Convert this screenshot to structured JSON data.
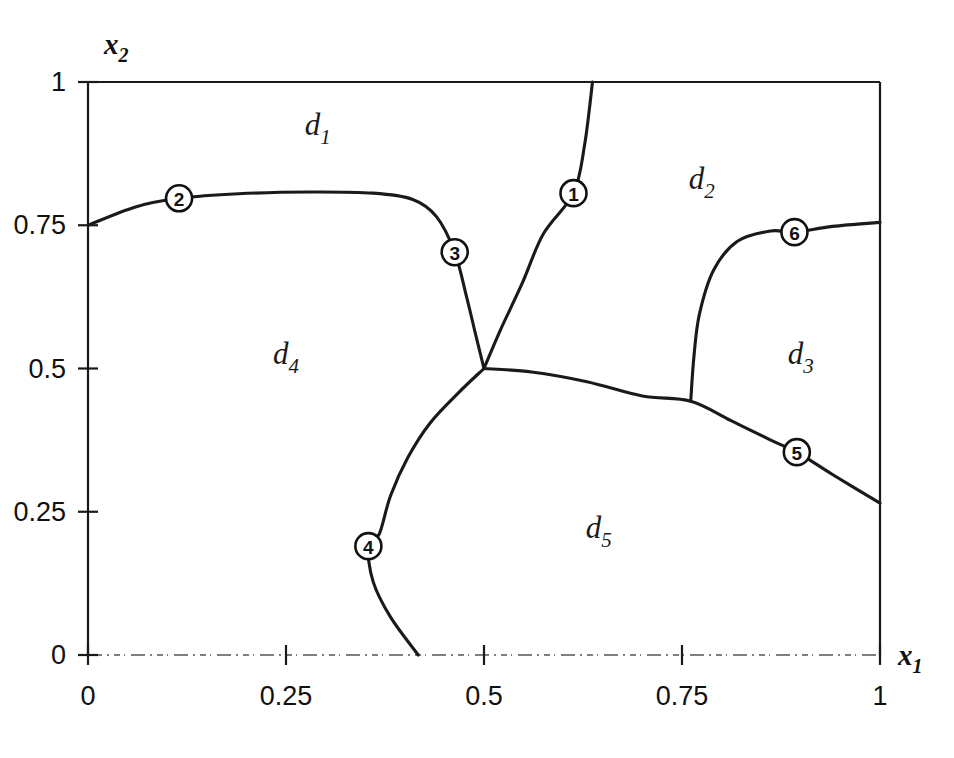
{
  "figure": {
    "kind": "region-partition-diagram",
    "background": "#ffffff",
    "ink_color": "#1a1a1a"
  },
  "chart_data": {
    "type": "scatter",
    "title": "",
    "subtitle": "",
    "xlabel": "x_1",
    "ylabel": "x_2",
    "xlim": [
      0,
      1
    ],
    "ylim": [
      0,
      1
    ],
    "grid": false,
    "legend": "none",
    "xticks": [
      "0",
      "0.25",
      "0.5",
      "0.75",
      "1"
    ],
    "xtick_values": [
      0,
      0.25,
      0.5,
      0.75,
      1
    ],
    "yticks": [
      "0",
      "0.25",
      "0.5",
      "0.75",
      "1"
    ],
    "ytick_values": [
      0,
      0.25,
      0.5,
      0.75,
      1
    ],
    "regions": [
      {
        "id": "d1",
        "label": "d",
        "sub": "1",
        "x": 0.29,
        "y": 0.925
      },
      {
        "id": "d2",
        "label": "d",
        "sub": "2",
        "x": 0.775,
        "y": 0.83
      },
      {
        "id": "d3",
        "label": "d",
        "sub": "3",
        "x": 0.9,
        "y": 0.525
      },
      {
        "id": "d4",
        "label": "d",
        "sub": "4",
        "x": 0.25,
        "y": 0.525
      },
      {
        "id": "d5",
        "label": "d",
        "sub": "5",
        "x": 0.645,
        "y": 0.222
      }
    ],
    "markers": [
      {
        "id": 1,
        "label": "1",
        "x": 0.613,
        "y": 0.806
      },
      {
        "id": 2,
        "label": "2",
        "x": 0.115,
        "y": 0.797
      },
      {
        "id": 3,
        "label": "3",
        "x": 0.463,
        "y": 0.703
      },
      {
        "id": 4,
        "label": "4",
        "x": 0.354,
        "y": 0.19
      },
      {
        "id": 5,
        "label": "5",
        "x": 0.895,
        "y": 0.354
      },
      {
        "id": 6,
        "label": "6",
        "x": 0.892,
        "y": 0.738
      }
    ],
    "junctions": [
      {
        "id": "j1",
        "x": 0.5,
        "y": 0.5
      },
      {
        "id": "j2",
        "x": 0.761,
        "y": 0.443
      }
    ],
    "boundaries": [
      {
        "id": "b-d1-d4",
        "between": [
          "d1",
          "d4"
        ],
        "points": [
          [
            0.0,
            0.75
          ],
          [
            0.06,
            0.782
          ],
          [
            0.115,
            0.797
          ],
          [
            0.19,
            0.805
          ],
          [
            0.28,
            0.808
          ],
          [
            0.36,
            0.806
          ],
          [
            0.41,
            0.795
          ],
          [
            0.44,
            0.765
          ],
          [
            0.463,
            0.703
          ],
          [
            0.478,
            0.625
          ],
          [
            0.49,
            0.556
          ],
          [
            0.5,
            0.5
          ]
        ]
      },
      {
        "id": "b-d1-d2",
        "between": [
          "d1",
          "d2"
        ],
        "points": [
          [
            0.5,
            0.5
          ],
          [
            0.52,
            0.565
          ],
          [
            0.548,
            0.648
          ],
          [
            0.575,
            0.735
          ],
          [
            0.613,
            0.806
          ],
          [
            0.627,
            0.89
          ],
          [
            0.637,
            1.0
          ]
        ]
      },
      {
        "id": "b-d4-d5",
        "between": [
          "d4",
          "d5"
        ],
        "points": [
          [
            0.5,
            0.5
          ],
          [
            0.468,
            0.458
          ],
          [
            0.432,
            0.405
          ],
          [
            0.404,
            0.345
          ],
          [
            0.382,
            0.278
          ],
          [
            0.368,
            0.212
          ],
          [
            0.354,
            0.19
          ],
          [
            0.36,
            0.128
          ],
          [
            0.382,
            0.066
          ],
          [
            0.417,
            0.0
          ]
        ]
      },
      {
        "id": "b-d2d3-d5",
        "between": [
          "d2",
          "d5",
          "d3"
        ],
        "points": [
          [
            0.5,
            0.5
          ],
          [
            0.56,
            0.494
          ],
          [
            0.63,
            0.477
          ],
          [
            0.7,
            0.452
          ],
          [
            0.761,
            0.443
          ],
          [
            0.812,
            0.409
          ],
          [
            0.862,
            0.375
          ],
          [
            0.895,
            0.354
          ],
          [
            0.94,
            0.315
          ],
          [
            1.0,
            0.265
          ]
        ]
      },
      {
        "id": "b-d2-d3",
        "between": [
          "d2",
          "d3"
        ],
        "points": [
          [
            0.761,
            0.443
          ],
          [
            0.765,
            0.52
          ],
          [
            0.772,
            0.595
          ],
          [
            0.79,
            0.672
          ],
          [
            0.82,
            0.722
          ],
          [
            0.862,
            0.74
          ],
          [
            0.892,
            0.738
          ],
          [
            0.94,
            0.748
          ],
          [
            1.0,
            0.755
          ]
        ]
      }
    ],
    "frame": {
      "left_axis": {
        "from": [
          0,
          0
        ],
        "to": [
          0,
          1
        ]
      },
      "top_axis": {
        "from": [
          0,
          1
        ],
        "to": [
          1,
          1
        ]
      },
      "right_axis": {
        "from": [
          1,
          0
        ],
        "to": [
          1,
          1
        ]
      },
      "bottom_axis": {
        "from": [
          0,
          0
        ],
        "to": [
          1,
          0
        ],
        "style": "dash-dot-faint"
      }
    }
  }
}
